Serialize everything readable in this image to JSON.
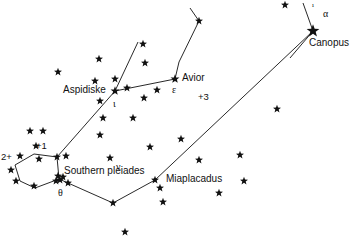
{
  "chart_data": {
    "type": "scatter",
    "xlabel": "",
    "ylabel": "",
    "xlim": [
      0,
      352
    ],
    "ylim": [
      0,
      249
    ],
    "grid": false,
    "legend": "none",
    "background_color": "#ffffff",
    "star_color": "#111111",
    "line_color": "#111111",
    "named_stars": [
      {
        "name": "Canopus",
        "greek": "α",
        "x": 313,
        "y": 31,
        "size": 11
      },
      {
        "name": "Avior",
        "greek": "ε",
        "x": 175,
        "y": 79,
        "size": 7
      },
      {
        "name": "Aspidiske",
        "greek": "ι",
        "x": 115,
        "y": 91,
        "size": 7
      },
      {
        "name": "Southern pleiades",
        "greek": "θ",
        "x": 59,
        "y": 179,
        "size": 7
      },
      {
        "name": "Miaplacadus",
        "greek": "",
        "x": 155,
        "y": 180,
        "size": 6
      }
    ],
    "magnitude_key": [
      {
        "label": "2+",
        "x": 4,
        "y": 157
      },
      {
        "label": "+1",
        "x": 38,
        "y": 146
      },
      {
        "label": "+3",
        "x": 200,
        "y": 98
      }
    ],
    "stars": [
      {
        "x": 313,
        "y": 31,
        "size": 11
      },
      {
        "x": 285,
        "y": 5,
        "size": 6
      },
      {
        "x": 199,
        "y": 21,
        "size": 6
      },
      {
        "x": 175,
        "y": 79,
        "size": 7
      },
      {
        "x": 143,
        "y": 44,
        "size": 6
      },
      {
        "x": 145,
        "y": 63,
        "size": 6
      },
      {
        "x": 99,
        "y": 59,
        "size": 6
      },
      {
        "x": 58,
        "y": 72,
        "size": 6
      },
      {
        "x": 95,
        "y": 81,
        "size": 6
      },
      {
        "x": 115,
        "y": 79,
        "size": 6
      },
      {
        "x": 115,
        "y": 91,
        "size": 7
      },
      {
        "x": 127,
        "y": 88,
        "size": 6
      },
      {
        "x": 157,
        "y": 90,
        "size": 6
      },
      {
        "x": 100,
        "y": 101,
        "size": 6
      },
      {
        "x": 144,
        "y": 98,
        "size": 6
      },
      {
        "x": 103,
        "y": 118,
        "size": 6
      },
      {
        "x": 133,
        "y": 118,
        "size": 6
      },
      {
        "x": 100,
        "y": 135,
        "size": 6
      },
      {
        "x": 30,
        "y": 131,
        "size": 6
      },
      {
        "x": 43,
        "y": 131,
        "size": 6
      },
      {
        "x": 36,
        "y": 146,
        "size": 6
      },
      {
        "x": 20,
        "y": 156,
        "size": 6
      },
      {
        "x": 39,
        "y": 159,
        "size": 6
      },
      {
        "x": 11,
        "y": 170,
        "size": 6
      },
      {
        "x": 16,
        "y": 181,
        "size": 6
      },
      {
        "x": 34,
        "y": 186,
        "size": 6
      },
      {
        "x": 57,
        "y": 157,
        "size": 6
      },
      {
        "x": 58,
        "y": 176,
        "size": 6
      },
      {
        "x": 60,
        "y": 180,
        "size": 6
      },
      {
        "x": 56,
        "y": 181,
        "size": 6
      },
      {
        "x": 63,
        "y": 177,
        "size": 6
      },
      {
        "x": 68,
        "y": 183,
        "size": 6
      },
      {
        "x": 66,
        "y": 156,
        "size": 6
      },
      {
        "x": 113,
        "y": 203,
        "size": 6
      },
      {
        "x": 110,
        "y": 158,
        "size": 6
      },
      {
        "x": 150,
        "y": 147,
        "size": 6
      },
      {
        "x": 181,
        "y": 139,
        "size": 6
      },
      {
        "x": 155,
        "y": 180,
        "size": 6
      },
      {
        "x": 160,
        "y": 188,
        "size": 6
      },
      {
        "x": 199,
        "y": 160,
        "size": 6
      },
      {
        "x": 240,
        "y": 155,
        "size": 6
      },
      {
        "x": 244,
        "y": 181,
        "size": 6
      },
      {
        "x": 219,
        "y": 193,
        "size": 6
      },
      {
        "x": 163,
        "y": 202,
        "size": 6
      },
      {
        "x": 277,
        "y": 109,
        "size": 6
      },
      {
        "x": 125,
        "y": 232,
        "size": 6
      }
    ],
    "constellation_lines": [
      {
        "points": [
          [
            190,
            8
          ],
          [
            199,
            21
          ],
          [
            179,
            62
          ],
          [
            175,
            79
          ]
        ]
      },
      {
        "points": [
          [
            175,
            79
          ],
          [
            115,
            91
          ]
        ]
      },
      {
        "points": [
          [
            115,
            91
          ],
          [
            138,
            42
          ]
        ]
      },
      {
        "points": [
          [
            115,
            91
          ],
          [
            57,
            157
          ]
        ]
      },
      {
        "points": [
          [
            57,
            157
          ],
          [
            34,
            154
          ]
        ]
      },
      {
        "points": [
          [
            34,
            154
          ],
          [
            15,
            165
          ]
        ]
      },
      {
        "points": [
          [
            15,
            165
          ],
          [
            20,
            181
          ]
        ]
      },
      {
        "points": [
          [
            20,
            181
          ],
          [
            35,
            188
          ]
        ]
      },
      {
        "points": [
          [
            35,
            188
          ],
          [
            59,
            179
          ]
        ]
      },
      {
        "points": [
          [
            59,
            179
          ],
          [
            57,
            157
          ]
        ]
      },
      {
        "points": [
          [
            59,
            179
          ],
          [
            113,
            203
          ]
        ]
      },
      {
        "points": [
          [
            113,
            203
          ],
          [
            155,
            180
          ]
        ]
      },
      {
        "points": [
          [
            155,
            180
          ],
          [
            313,
            31
          ]
        ]
      },
      {
        "points": [
          [
            313,
            31
          ],
          [
            303,
            3
          ]
        ]
      },
      {
        "points": [
          [
            313,
            31
          ],
          [
            290,
            58
          ]
        ]
      }
    ]
  },
  "labels": {
    "canopus": "Canopus",
    "canopus_greek": "α",
    "canopus_tick": "ı",
    "avior": "Avior",
    "avior_greek": "ε",
    "aspidiske": "Aspidiske",
    "aspidiske_greek": "ι",
    "southern_pleiades": "Southern pleiades",
    "southern_pleiades_greek": "θ",
    "miaplacadus": "Miaplacadus",
    "nu_greek": "ν",
    "mag_two": "2+",
    "mag_one": "+1",
    "mag_three": "+3"
  }
}
